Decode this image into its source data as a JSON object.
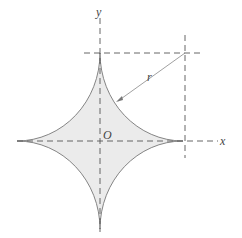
{
  "diagram": {
    "labels": {
      "y_axis": "y",
      "x_axis": "x",
      "origin": "O",
      "radius": "r"
    },
    "colors": {
      "fill": "#ebebeb",
      "stroke": "#777777",
      "axis": "#555555"
    }
  }
}
